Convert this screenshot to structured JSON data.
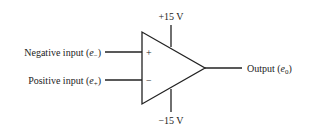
{
  "diagram": {
    "supply_positive": "+15 V",
    "supply_negative": "−15 V",
    "inputs": [
      {
        "label": "Negative input (",
        "symbol": "e",
        "subscript": "−",
        "close": ")",
        "pin_sign": "+"
      },
      {
        "label": "Positive input (",
        "symbol": "e",
        "subscript": "+",
        "close": ")",
        "pin_sign": "−"
      }
    ],
    "output": {
      "label": "Output (",
      "symbol": "e",
      "subscript": "0",
      "close": ")"
    }
  }
}
